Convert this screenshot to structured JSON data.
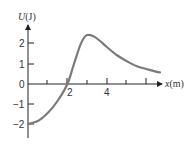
{
  "chart_data": {
    "type": "line",
    "title": "",
    "xlabel": "x (m)",
    "ylabel": "U (J)",
    "xlim": [
      0,
      6.8
    ],
    "ylim": [
      -2.7,
      2.9
    ],
    "x_ticks": [
      1,
      2,
      3,
      4,
      5,
      6
    ],
    "x_tick_labels": {
      "2": "2",
      "4": "4"
    },
    "y_ticks": [
      -2,
      -1,
      0,
      1,
      2
    ],
    "y_tick_labels": [
      "-2",
      "-1",
      "0",
      "1",
      "2"
    ],
    "grid": false,
    "legend": null,
    "series": [
      {
        "name": "U(x)",
        "x": [
          0,
          0.5,
          1.0,
          1.5,
          2.0,
          2.3,
          2.6,
          2.8,
          3.0,
          3.3,
          3.6,
          4.0,
          4.5,
          5.0,
          5.5,
          6.0,
          6.5,
          6.7
        ],
        "values": [
          -2.0,
          -1.85,
          -1.45,
          -0.85,
          0.0,
          0.9,
          1.8,
          2.25,
          2.45,
          2.4,
          2.2,
          1.85,
          1.45,
          1.15,
          0.9,
          0.75,
          0.62,
          0.58
        ]
      }
    ]
  },
  "labels": {
    "y_axis_title_U": "U",
    "y_axis_title_unit": "(J)",
    "x_axis_title_x": "x",
    "x_axis_title_unit": "(m)",
    "y_tick_2": "2",
    "y_tick_1": "1",
    "y_tick_0": "0",
    "y_tick_m1": "−1",
    "y_tick_m2": "−2",
    "x_tick_2": "2",
    "x_tick_4": "4"
  },
  "colors": {
    "curve": "#7a7a7a",
    "axis": "#222222"
  }
}
